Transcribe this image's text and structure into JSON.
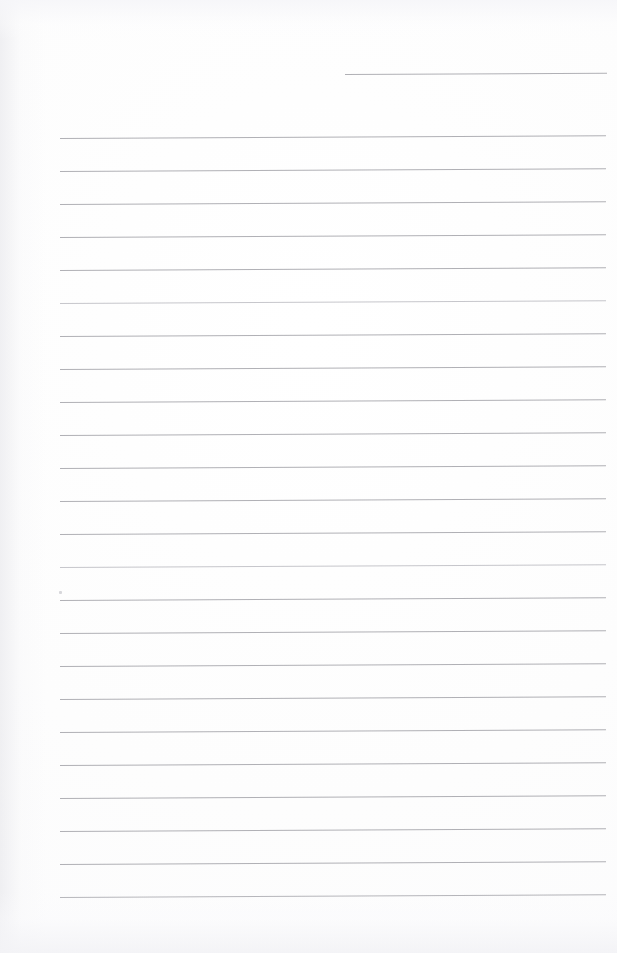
{
  "document": {
    "kind": "scanned-blank-ruled-notepad-page",
    "page_width": 617,
    "page_height": 953,
    "background_color": "#fdfdfd",
    "rule_color": "#a9a9af",
    "visible_text": "",
    "handwriting_present": "none",
    "notes_label": ""
  },
  "ruling": {
    "line_count": 25,
    "spacing_px": 33,
    "left_margin_x": 60,
    "right_margin_x": 605,
    "first_full_line_y": 138,
    "last_line_y": 897,
    "tilt_degrees": -0.28,
    "lines": [
      {
        "id": "rule-0",
        "y": 74,
        "x_start": 345,
        "x_end": 607,
        "partial": true,
        "faint": false
      },
      {
        "id": "rule-1",
        "y": 138,
        "x_start": 60,
        "x_end": 606,
        "partial": false,
        "faint": false
      },
      {
        "id": "rule-2",
        "y": 171,
        "x_start": 60,
        "x_end": 606,
        "partial": false,
        "faint": false
      },
      {
        "id": "rule-3",
        "y": 204,
        "x_start": 60,
        "x_end": 606,
        "partial": false,
        "faint": false
      },
      {
        "id": "rule-4",
        "y": 237,
        "x_start": 60,
        "x_end": 606,
        "partial": false,
        "faint": false
      },
      {
        "id": "rule-5",
        "y": 270,
        "x_start": 60,
        "x_end": 606,
        "partial": false,
        "faint": false
      },
      {
        "id": "rule-6",
        "y": 303,
        "x_start": 60,
        "x_end": 606,
        "partial": false,
        "faint": true
      },
      {
        "id": "rule-7",
        "y": 336,
        "x_start": 60,
        "x_end": 606,
        "partial": false,
        "faint": false
      },
      {
        "id": "rule-8",
        "y": 369,
        "x_start": 60,
        "x_end": 606,
        "partial": false,
        "faint": false
      },
      {
        "id": "rule-9",
        "y": 402,
        "x_start": 60,
        "x_end": 606,
        "partial": false,
        "faint": false
      },
      {
        "id": "rule-10",
        "y": 435,
        "x_start": 60,
        "x_end": 606,
        "partial": false,
        "faint": false
      },
      {
        "id": "rule-11",
        "y": 468,
        "x_start": 60,
        "x_end": 606,
        "partial": false,
        "faint": false
      },
      {
        "id": "rule-12",
        "y": 501,
        "x_start": 60,
        "x_end": 606,
        "partial": false,
        "faint": false
      },
      {
        "id": "rule-13",
        "y": 534,
        "x_start": 60,
        "x_end": 606,
        "partial": false,
        "faint": false
      },
      {
        "id": "rule-14",
        "y": 567,
        "x_start": 60,
        "x_end": 606,
        "partial": false,
        "faint": true
      },
      {
        "id": "rule-15",
        "y": 600,
        "x_start": 60,
        "x_end": 606,
        "partial": false,
        "faint": false
      },
      {
        "id": "rule-16",
        "y": 633,
        "x_start": 60,
        "x_end": 606,
        "partial": false,
        "faint": false
      },
      {
        "id": "rule-17",
        "y": 666,
        "x_start": 60,
        "x_end": 606,
        "partial": false,
        "faint": false
      },
      {
        "id": "rule-18",
        "y": 699,
        "x_start": 60,
        "x_end": 606,
        "partial": false,
        "faint": false
      },
      {
        "id": "rule-19",
        "y": 732,
        "x_start": 60,
        "x_end": 606,
        "partial": false,
        "faint": false
      },
      {
        "id": "rule-20",
        "y": 765,
        "x_start": 60,
        "x_end": 606,
        "partial": false,
        "faint": false
      },
      {
        "id": "rule-21",
        "y": 798,
        "x_start": 60,
        "x_end": 606,
        "partial": false,
        "faint": false
      },
      {
        "id": "rule-22",
        "y": 831,
        "x_start": 60,
        "x_end": 606,
        "partial": false,
        "faint": false
      },
      {
        "id": "rule-23",
        "y": 864,
        "x_start": 60,
        "x_end": 606,
        "partial": false,
        "faint": false
      },
      {
        "id": "rule-24",
        "y": 897,
        "x_start": 60,
        "x_end": 606,
        "partial": false,
        "faint": false
      }
    ]
  },
  "artifacts": {
    "speck": {
      "x": 59,
      "y": 591
    },
    "left_gutter_shading": true,
    "top_bleed_through": true,
    "bottom_bleed_through": true
  }
}
